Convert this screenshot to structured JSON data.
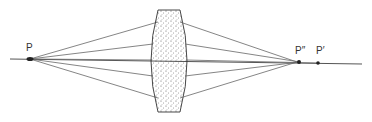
{
  "diagram": {
    "type": "optics-ray-diagram",
    "colors": {
      "line": "#555555",
      "point": "#222222",
      "lens_fill": "#f4f4f4",
      "stipple": "#444444"
    },
    "labels": {
      "object_point": "P",
      "marginal_focus": "P″",
      "paraxial_focus": "P′"
    },
    "points": {
      "object": {
        "x": 30,
        "y": 59
      },
      "marginal_focus": {
        "x": 299,
        "y": 62
      },
      "paraxial_focus": {
        "x": 318,
        "y": 63
      }
    },
    "axis": {
      "x1": 10,
      "y1": 59,
      "x2": 362,
      "y2": 64
    },
    "lens": {
      "x_left": 150,
      "x_right": 186,
      "top": 10,
      "bottom": 112
    },
    "rays": [
      {
        "lens_y": 22,
        "focus_x": 296
      },
      {
        "lens_y": 44,
        "focus_x": 302
      },
      {
        "lens_y": 60,
        "focus_x": 318
      },
      {
        "lens_y": 76,
        "focus_x": 302
      },
      {
        "lens_y": 98,
        "focus_x": 296
      }
    ]
  }
}
